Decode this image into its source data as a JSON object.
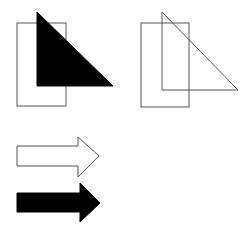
{
  "colors": {
    "background": "#ffffff",
    "stroke": "#555555",
    "fill_dark": "#000000",
    "fill_light": "#ffffff"
  },
  "shapes": {
    "group_left": {
      "rectangle": {
        "x": 17,
        "y": 23,
        "width": 49,
        "height": 83,
        "fill": "none"
      },
      "triangle": {
        "points": "37,12 37,86 113,86",
        "fill": "#000000"
      }
    },
    "group_right": {
      "rectangle": {
        "x": 141,
        "y": 23,
        "width": 48,
        "height": 84,
        "fill": "none"
      },
      "triangle": {
        "points": "162,12 162,90 238,90",
        "fill": "none"
      }
    },
    "arrow_outline": {
      "points": "17,146 78,146 78,137 99,156 78,177 78,166 17,166",
      "fill": "#ffffff"
    },
    "arrow_filled": {
      "points": "17,193 80,193 80,183 100,203 80,222 80,212 17,212",
      "fill": "#000000"
    }
  }
}
